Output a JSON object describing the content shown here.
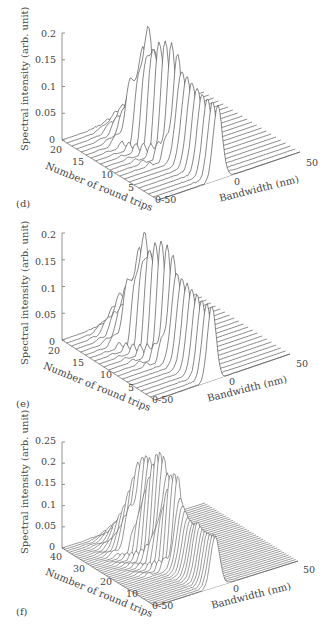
{
  "chart_data": [
    {
      "panel": "(d)",
      "type": "3d-waterfall-line",
      "zlabel": "Spectral intensity (arb. unit)",
      "ylabel": "Number of round trips",
      "xlabel": "Bandwidth (nm)",
      "z_ticks": [
        "0",
        "0.05",
        "0.1",
        "0.15",
        "0.2"
      ],
      "y_ticks": [
        "0",
        "5",
        "10",
        "15",
        "20"
      ],
      "x_ticks": [
        "-50",
        "0",
        "50"
      ],
      "zlim": [
        0,
        0.2
      ],
      "ylim": [
        0,
        20
      ],
      "xlim": [
        -50,
        50
      ],
      "n_traces": 21,
      "series_peaks": [
        {
          "round_trip": 20,
          "peak": 0.01
        },
        {
          "round_trip": 18,
          "peak": 0.04
        },
        {
          "round_trip": 16,
          "peak": 0.08
        },
        {
          "round_trip": 14,
          "peak": 0.21
        },
        {
          "round_trip": 12,
          "peak": 0.19
        },
        {
          "round_trip": 10,
          "peak": 0.18
        },
        {
          "round_trip": 8,
          "peak": 0.17
        },
        {
          "round_trip": 6,
          "peak": 0.16
        },
        {
          "round_trip": 4,
          "peak": 0.15
        },
        {
          "round_trip": 2,
          "peak": 0.14
        }
      ],
      "peak_center_nm": 0,
      "grid": false
    },
    {
      "panel": "(e)",
      "type": "3d-waterfall-line",
      "zlabel": "Spectral intensity (arb. unit)",
      "ylabel": "Number of round trips",
      "xlabel": "Bandwidth (nm)",
      "z_ticks": [
        "0",
        "0.05",
        "0.1",
        "0.15",
        "0.2"
      ],
      "y_ticks": [
        "0",
        "5",
        "10",
        "15",
        "20"
      ],
      "x_ticks": [
        "-50",
        "0",
        "50"
      ],
      "zlim": [
        0,
        0.2
      ],
      "ylim": [
        0,
        20
      ],
      "xlim": [
        -50,
        50
      ],
      "n_traces": 21,
      "series_peaks": [
        {
          "round_trip": 20,
          "peak": 0.01
        },
        {
          "round_trip": 18,
          "peak": 0.06
        },
        {
          "round_trip": 16,
          "peak": 0.09
        },
        {
          "round_trip": 14,
          "peak": 0.2
        },
        {
          "round_trip": 12,
          "peak": 0.19
        },
        {
          "round_trip": 10,
          "peak": 0.18
        },
        {
          "round_trip": 8,
          "peak": 0.17
        },
        {
          "round_trip": 6,
          "peak": 0.16
        },
        {
          "round_trip": 4,
          "peak": 0.15
        },
        {
          "round_trip": 2,
          "peak": 0.14
        }
      ],
      "peak_center_nm": 0,
      "grid": false
    },
    {
      "panel": "(f)",
      "type": "3d-waterfall-line",
      "zlabel": "Spectral intensity (arb. unit)",
      "ylabel": "Number of round trips",
      "xlabel": "Bandwidth (nm)",
      "z_ticks": [
        "0",
        "0.05",
        "0.1",
        "0.15",
        "0.2",
        "0.25"
      ],
      "y_ticks": [
        "0",
        "10",
        "20",
        "30",
        "40"
      ],
      "x_ticks": [
        "-50",
        "0",
        "50"
      ],
      "zlim": [
        0,
        0.25
      ],
      "ylim": [
        0,
        40
      ],
      "xlim": [
        -50,
        50
      ],
      "n_traces": 41,
      "series_peaks": [
        {
          "round_trip": 40,
          "peak": 0.01
        },
        {
          "round_trip": 36,
          "peak": 0.05
        },
        {
          "round_trip": 33,
          "peak": 0.1
        },
        {
          "round_trip": 30,
          "peak": 0.17
        },
        {
          "round_trip": 27,
          "peak": 0.2
        },
        {
          "round_trip": 25,
          "peak": 0.2
        },
        {
          "round_trip": 23,
          "peak": 0.21
        },
        {
          "round_trip": 21,
          "peak": 0.21
        },
        {
          "round_trip": 19,
          "peak": 0.18
        },
        {
          "round_trip": 17,
          "peak": 0.2
        },
        {
          "round_trip": 15,
          "peak": 0.18
        },
        {
          "round_trip": 13,
          "peak": 0.15
        },
        {
          "round_trip": 11,
          "peak": 0.13
        },
        {
          "round_trip": 9,
          "peak": 0.12
        },
        {
          "round_trip": 7,
          "peak": 0.13
        },
        {
          "round_trip": 5,
          "peak": 0.12
        },
        {
          "round_trip": 3,
          "peak": 0.12
        }
      ],
      "peak_center_nm": 0,
      "grid": false
    }
  ],
  "panels": [
    {
      "id": "d",
      "label": "(d)",
      "top": 0
    },
    {
      "id": "e",
      "label": "(e)",
      "top": 213
    },
    {
      "id": "f",
      "label": "(f)",
      "top": 426
    }
  ],
  "style": {
    "line_color": "#555555",
    "axis_color": "#777777",
    "text_color": "#444444"
  }
}
